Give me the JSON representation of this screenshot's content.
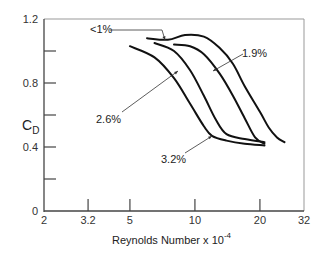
{
  "chart_data": {
    "type": "line",
    "title": "",
    "xlabel": "Reynolds Number x 10",
    "xlabel_exponent": "-4",
    "ylabel": "C",
    "ylabel_subscript": "D",
    "xscale": "log",
    "xlim": [
      2,
      32
    ],
    "ylim": [
      0,
      1.2
    ],
    "x_ticks": [
      "2",
      "3.2",
      "5",
      "10",
      "20",
      "32"
    ],
    "y_ticks": [
      "0",
      "0.4",
      "0.8",
      "1.2"
    ],
    "y_minor_ticks": [
      0.2,
      0.6,
      1.0
    ],
    "grid": false,
    "legend": "inline annotations",
    "series": [
      {
        "name": "<1%",
        "x": [
          6.0,
          7.5,
          9.0,
          11,
          13,
          15,
          17,
          20,
          22,
          24,
          26
        ],
        "y": [
          1.08,
          1.07,
          1.1,
          1.09,
          1.02,
          0.92,
          0.78,
          0.62,
          0.52,
          0.46,
          0.43
        ]
      },
      {
        "name": "1.9%",
        "x": [
          8.0,
          9.5,
          11,
          13,
          15,
          17,
          19,
          21
        ],
        "y": [
          1.04,
          1.03,
          0.98,
          0.86,
          0.72,
          0.58,
          0.46,
          0.42
        ]
      },
      {
        "name": "2.6%",
        "x": [
          6.5,
          8,
          9.5,
          11,
          12.5,
          14,
          17,
          21
        ],
        "y": [
          1.05,
          1.0,
          0.88,
          0.72,
          0.57,
          0.48,
          0.45,
          0.43
        ]
      },
      {
        "name": "3.2%",
        "x": [
          5.0,
          6.5,
          8,
          9.5,
          11,
          12,
          14,
          17,
          21
        ],
        "y": [
          1.03,
          0.96,
          0.83,
          0.67,
          0.53,
          0.47,
          0.44,
          0.42,
          0.41
        ]
      }
    ],
    "annotations": [
      {
        "text": "<1%",
        "points_to": "<1% curve near Re 10"
      },
      {
        "text": "1.9%",
        "points_to": "1.9% curve near Re 13"
      },
      {
        "text": "2.6%",
        "points_to": "2.6% curve near Re 9"
      },
      {
        "text": "3.2%",
        "points_to": "3.2% curve near Re 11"
      }
    ]
  }
}
